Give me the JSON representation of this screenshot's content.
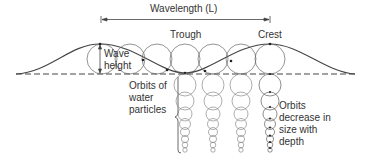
{
  "diagram": {
    "wavelength_label": "Wavelength (L)",
    "trough_label": "Trough",
    "crest_label": "Crest",
    "wave_height_label_line1": "Wave",
    "wave_height_label_line2": "height",
    "orbits_label_line1": "Orbits of",
    "orbits_label_line2": "water",
    "orbits_label_line3": "particles",
    "decrease_label_line1": "Orbits",
    "decrease_label_line2": "decrease in",
    "decrease_label_line3": "size with",
    "decrease_label_line4": "depth"
  }
}
